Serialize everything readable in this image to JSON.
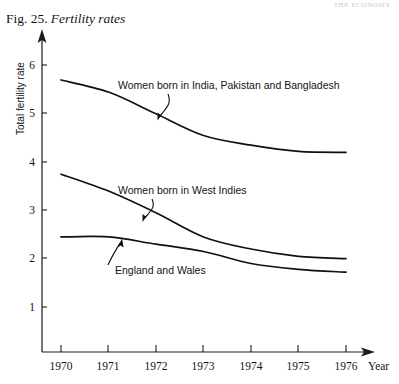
{
  "page": {
    "running_head": "THE ECONOMY",
    "caption_number": "Fig. 25.",
    "caption_title": "Fertility rates"
  },
  "chart_data": {
    "type": "line",
    "title": "Fertility rates",
    "xlabel": "Year",
    "ylabel": "Total fertility rate",
    "x": [
      1970,
      1971,
      1972,
      1973,
      1974,
      1975,
      1976
    ],
    "xtick_labels": [
      "1970",
      "1971",
      "1972",
      "1973",
      "1974",
      "1975",
      "1976"
    ],
    "ytick_labels": [
      "1",
      "2",
      "3",
      "4",
      "5",
      "6"
    ],
    "yticks": [
      1,
      2,
      3,
      4,
      5,
      6
    ],
    "xlim": [
      1970,
      1976
    ],
    "ylim": [
      0,
      6.6
    ],
    "grid": false,
    "legend": "inline-annotations",
    "series": [
      {
        "name": "Women born in India, Pakistan and Bangladesh",
        "values": [
          5.7,
          5.45,
          5.0,
          4.55,
          4.35,
          4.22,
          4.2
        ]
      },
      {
        "name": "Women born in West Indies",
        "values": [
          3.75,
          3.4,
          2.95,
          2.45,
          2.2,
          2.05,
          2.0
        ]
      },
      {
        "name": "England and Wales",
        "values": [
          2.45,
          2.45,
          2.3,
          2.15,
          1.9,
          1.78,
          1.72
        ]
      }
    ],
    "annotations": [
      {
        "text": "Women born in India, Pakistan and Bangladesh",
        "x": 1970.95,
        "y": 5.62
      },
      {
        "text": "Women born in West Indies",
        "x": 1970.9,
        "y": 3.42
      },
      {
        "text": "England and Wales",
        "x": 1970.6,
        "y": 1.92
      }
    ]
  }
}
